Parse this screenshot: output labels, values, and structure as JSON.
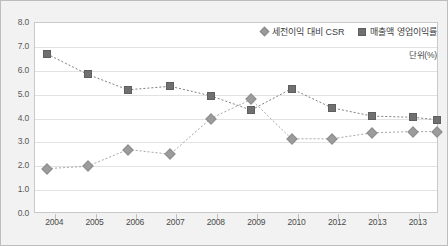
{
  "legend": {
    "position": "top-right",
    "entries": [
      {
        "marker": "diamond-icon",
        "label": "세전이익 대비 CSR",
        "color": "#9c9c9c"
      },
      {
        "marker": "square-icon",
        "label": "매출액 영업이익률",
        "color": "#707070"
      }
    ]
  },
  "unit_note": "단위(%)",
  "chart_data": {
    "type": "line",
    "title": "",
    "subtitle": "",
    "xlabel": "",
    "ylabel": "",
    "unit": "단위(%)",
    "ylim": [
      0.0,
      8.0
    ],
    "ytick_labels": [
      "0.0",
      "1.0",
      "2.0",
      "3.0",
      "4.0",
      "5.0",
      "6.0",
      "7.0",
      "8.0"
    ],
    "ytick_values": [
      0.0,
      1.0,
      2.0,
      3.0,
      4.0,
      5.0,
      6.0,
      7.0,
      8.0
    ],
    "xtick_labels": [
      "2004",
      "2005",
      "2006",
      "2007",
      "2008",
      "2009",
      "2010",
      "2012",
      "2013",
      "2013"
    ],
    "grid": true,
    "legend_position": "top-right",
    "x_positions_pct": [
      3.0,
      13.0,
      23.0,
      33.5,
      43.5,
      53.5,
      63.5,
      73.5,
      83.5,
      93.5,
      99.5
    ],
    "series": [
      {
        "name": "세전이익 대비 CSR",
        "marker": "diamond",
        "color": "#9c9c9c",
        "values": [
          1.9,
          2.0,
          2.7,
          2.5,
          4.0,
          4.8,
          3.15,
          3.15,
          3.4,
          3.45,
          3.45
        ]
      },
      {
        "name": "매출액 영업이익률",
        "marker": "square",
        "color": "#707070",
        "values": [
          6.7,
          5.85,
          5.2,
          5.35,
          4.95,
          4.35,
          5.25,
          4.45,
          4.1,
          4.05,
          3.95
        ]
      }
    ]
  }
}
